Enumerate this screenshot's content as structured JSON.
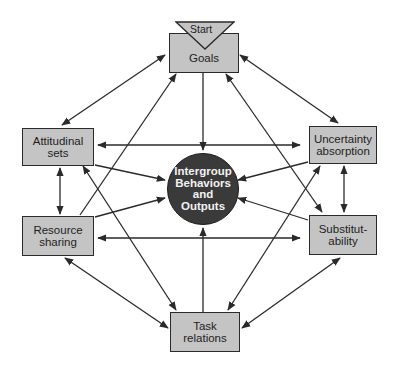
{
  "diagram": {
    "start_label": "Start",
    "center": {
      "label": "Intergroup\nBehaviors\nand\nOutputs"
    },
    "nodes": {
      "goals": "Goals",
      "attitudinal_sets": "Attitudinal\nsets",
      "uncertainty_absorption": "Uncertainty\nabsorption",
      "resource_sharing": "Resource\nsharing",
      "substitutability": "Substitut-\nability",
      "task_relations": "Task\nrelations"
    },
    "colors": {
      "box_fill": "#c4c4c4",
      "center_fill": "#3a3a3a",
      "line": "#2a2a2a"
    }
  }
}
